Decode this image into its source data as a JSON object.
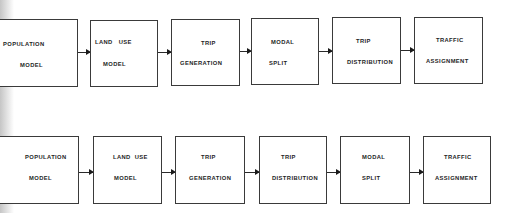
{
  "diagram": {
    "rows": [
      {
        "name": "sequence-a",
        "boxes": [
          {
            "line1": "POPULATION",
            "line2": "MODEL"
          },
          {
            "line1": "LAND   USE",
            "line2": "MODEL"
          },
          {
            "line1": "TRIP",
            "line2": "GENERATION"
          },
          {
            "line1": "MODAL",
            "line2": "SPLIT"
          },
          {
            "line1": "TRIP",
            "line2": "DISTRIBUTION"
          },
          {
            "line1": "TRAFFIC",
            "line2": "ASSIGNMENT"
          }
        ]
      },
      {
        "name": "sequence-b",
        "boxes": [
          {
            "line1": "POPULATION",
            "line2": "MODEL"
          },
          {
            "line1": "LAND  USE",
            "line2": "MODEL"
          },
          {
            "line1": "TRIP",
            "line2": "GENERATION"
          },
          {
            "line1": "TRIP",
            "line2": "DISTRIBUTION"
          },
          {
            "line1": "MODAL",
            "line2": "SPLIT"
          },
          {
            "line1": "TRAFFIC",
            "line2": "ASSIGNMENT"
          }
        ]
      }
    ],
    "colors": {
      "line": "#3a3a3a",
      "text": "#1e1e1e",
      "background": "#ffffff"
    }
  }
}
